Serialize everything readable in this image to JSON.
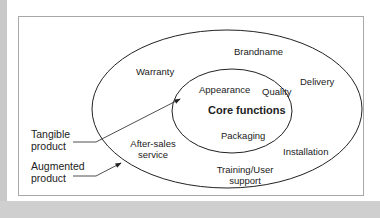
{
  "diagram": {
    "core": {
      "title": "Core functions",
      "items": [
        "Appearance",
        "Quality",
        "Packaging"
      ]
    },
    "tangible_ring": {
      "items": [
        "Brandname",
        "Delivery",
        "Installation",
        "Training/User support",
        "After-sales service",
        "Warranty"
      ]
    },
    "callouts": {
      "tangible_product": [
        "Tangible",
        "product"
      ],
      "augmented_product": [
        "Augmented",
        "product"
      ]
    },
    "labels": {
      "warranty": "Warranty",
      "brandname": "Brandname",
      "delivery": "Delivery",
      "appearance": "Appearance",
      "quality": "Quality",
      "core_functions": "Core functions",
      "packaging": "Packaging",
      "installation": "Installation",
      "training_line1": "Training/User",
      "training_line2": "support",
      "aftersales_line1": "After-sales",
      "aftersales_line2": "service",
      "tangible_line1": "Tangible",
      "tangible_line2": "product",
      "augmented_line1": "Augmented",
      "augmented_line2": "product"
    },
    "colors": {
      "line": "#222222",
      "frame": "#a8a8a8",
      "margin": "#c9c9c9"
    }
  }
}
